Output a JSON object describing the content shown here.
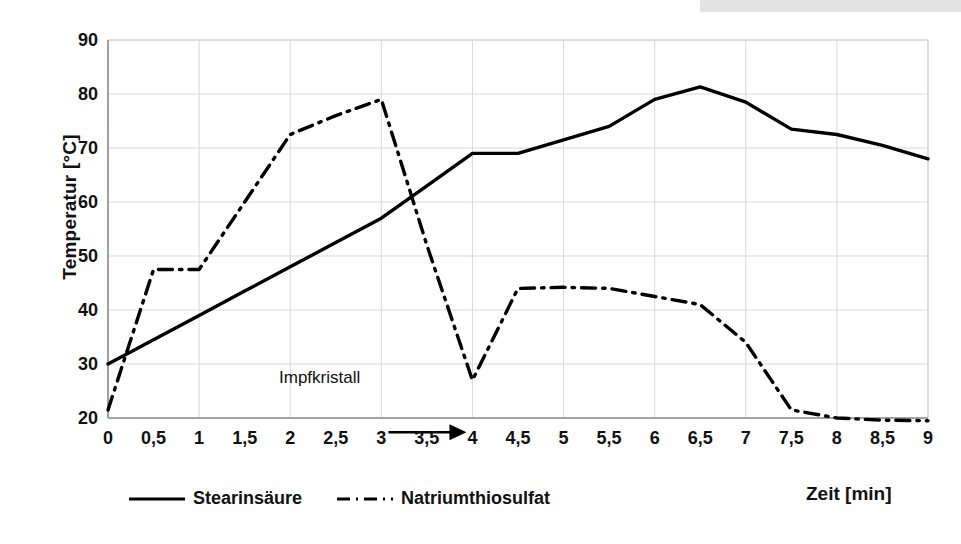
{
  "chart_data": {
    "type": "line",
    "title": "",
    "subtitle": "",
    "xlabel": "Zeit [min]",
    "ylabel": "Temperatur [°C]",
    "xlim": [
      0,
      9
    ],
    "ylim": [
      20,
      90
    ],
    "xticks": [
      "0",
      "0,5",
      "1",
      "1,5",
      "2",
      "2,5",
      "3",
      "3,5",
      "4",
      "4,5",
      "5",
      "5,5",
      "6",
      "6,5",
      "7",
      "7,5",
      "8",
      "8,5",
      "9"
    ],
    "yticks": [
      "20",
      "30",
      "40",
      "50",
      "60",
      "70",
      "80",
      "90"
    ],
    "grid": true,
    "legend_position": "bottom-left",
    "x": [
      0,
      0.5,
      1,
      1.5,
      2,
      2.5,
      3,
      3.5,
      4,
      4.5,
      5,
      5.5,
      6,
      6.5,
      7,
      7.5,
      8,
      8.5,
      9
    ],
    "series": [
      {
        "name": "Stearinsäure",
        "style": "solid",
        "color": "#000000",
        "values": [
          30.0,
          34.5,
          39.0,
          43.5,
          48.0,
          52.5,
          57.0,
          63.0,
          69.0,
          69.0,
          71.5,
          74.0,
          79.0,
          81.3,
          78.5,
          73.5,
          72.5,
          70.5,
          68.0
        ]
      },
      {
        "name": "Natriumthiosulfat",
        "style": "dash-dot",
        "color": "#000000",
        "values": [
          21.5,
          47.5,
          47.5,
          60.0,
          72.5,
          76.0,
          79.0,
          52.0,
          27.0,
          44.0,
          44.2,
          44.0,
          42.5,
          41.0,
          34.0,
          21.5,
          20.0,
          19.6,
          19.5
        ]
      }
    ],
    "annotations": [
      {
        "text": "Impfkristall",
        "points_to_x": 4,
        "points_to_y": 27,
        "arrow": "right-arrow"
      }
    ]
  },
  "legend": {
    "items": [
      {
        "label": "Stearinsäure",
        "style": "solid"
      },
      {
        "label": "Natriumthiosulfat",
        "style": "dash-dot"
      }
    ]
  }
}
